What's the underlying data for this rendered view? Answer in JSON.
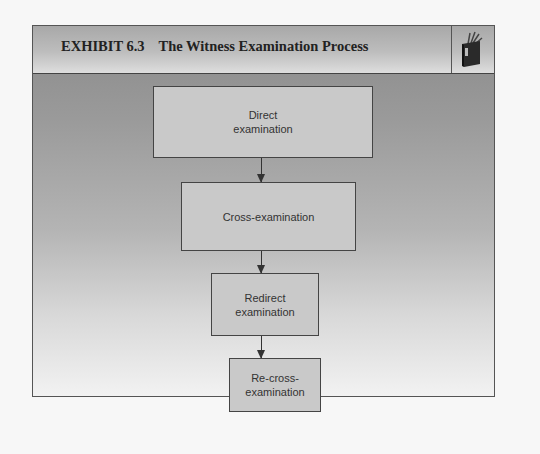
{
  "exhibit": {
    "number": "EXHIBIT 6.3",
    "title": "The Witness Examination Process",
    "icon": "book-icon"
  },
  "flow": {
    "steps": [
      {
        "label_line1": "Direct",
        "label_line2": "examination"
      },
      {
        "label_line1": "Cross-examination",
        "label_line2": ""
      },
      {
        "label_line1": "Redirect",
        "label_line2": "examination"
      },
      {
        "label_line1": "Re-cross-",
        "label_line2": "examination"
      }
    ],
    "connector": "down-arrow"
  }
}
